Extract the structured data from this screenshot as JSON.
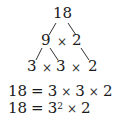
{
  "tree": {
    "root": "18",
    "level1": {
      "left": "9",
      "op": "×",
      "right": "2"
    },
    "level2": {
      "a": "3",
      "op1": "×",
      "b": "3",
      "op2": "×",
      "c": "2"
    }
  },
  "equations": [
    {
      "lhs": "18",
      "eq": "=",
      "t1": "3",
      "op1": "×",
      "t2": "3",
      "op2": "×",
      "t3": "2"
    },
    {
      "lhs": "18",
      "eq": "=",
      "base": "3",
      "exp": "2",
      "op1": "×",
      "t2": "2"
    }
  ]
}
